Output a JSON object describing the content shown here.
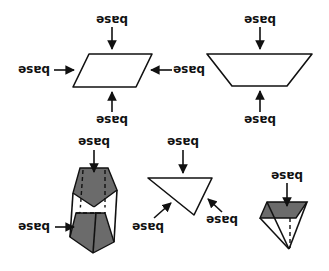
{
  "diagram": {
    "label_text": "base",
    "colors": {
      "line": "#111111",
      "face_fill": "#6b6b6b",
      "background": "#ffffff"
    },
    "shapes": [
      {
        "name": "parallelogram",
        "labels": [
          "base",
          "base",
          "base",
          "base"
        ]
      },
      {
        "name": "trapezoid",
        "labels": [
          "base",
          "base"
        ]
      },
      {
        "name": "pentagonal-prism",
        "labels": [
          "base",
          "base"
        ]
      },
      {
        "name": "triangle",
        "labels": [
          "base",
          "base",
          "base"
        ]
      },
      {
        "name": "square-pyramid",
        "labels": [
          "base"
        ]
      }
    ]
  }
}
